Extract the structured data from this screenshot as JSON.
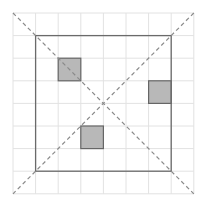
{
  "diagram": {
    "type": "grid-puzzle",
    "grid": {
      "rows": 8,
      "cols": 8,
      "origin_x": 13,
      "origin_y": 13,
      "cell_size": 22.6,
      "line_color": "#e2e2e2"
    },
    "inner_square": {
      "from_cell": [
        1,
        1
      ],
      "to_cell": [
        7,
        7
      ],
      "stroke": "#6a6a6a"
    },
    "diagonals": {
      "style": "dashed",
      "stroke": "#8a8a8a",
      "lines": [
        {
          "from": "top-left",
          "to": "bottom-right"
        },
        {
          "from": "top-right",
          "to": "bottom-left"
        }
      ]
    },
    "shaded_cells": {
      "fill": "#b8b8b8",
      "stroke": "#666666",
      "cells": [
        {
          "col": 2,
          "row": 2
        },
        {
          "col": 6,
          "row": 3
        },
        {
          "col": 3,
          "row": 5
        }
      ]
    }
  }
}
